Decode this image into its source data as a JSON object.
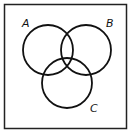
{
  "diagram": {
    "type": "venn",
    "sets": [
      {
        "label": "A",
        "cx": 48,
        "cy": 50,
        "r": 25,
        "label_x": 22,
        "label_y": 27
      },
      {
        "label": "B",
        "cx": 86,
        "cy": 50,
        "r": 25,
        "label_x": 106,
        "label_y": 27
      },
      {
        "label": "C",
        "cx": 67,
        "cy": 83,
        "r": 25,
        "label_x": 90,
        "label_y": 112
      }
    ],
    "frame": {
      "x": 4,
      "y": 4,
      "width": 122,
      "height": 124
    },
    "stroke_color": "#111111",
    "background": "#ffffff"
  }
}
